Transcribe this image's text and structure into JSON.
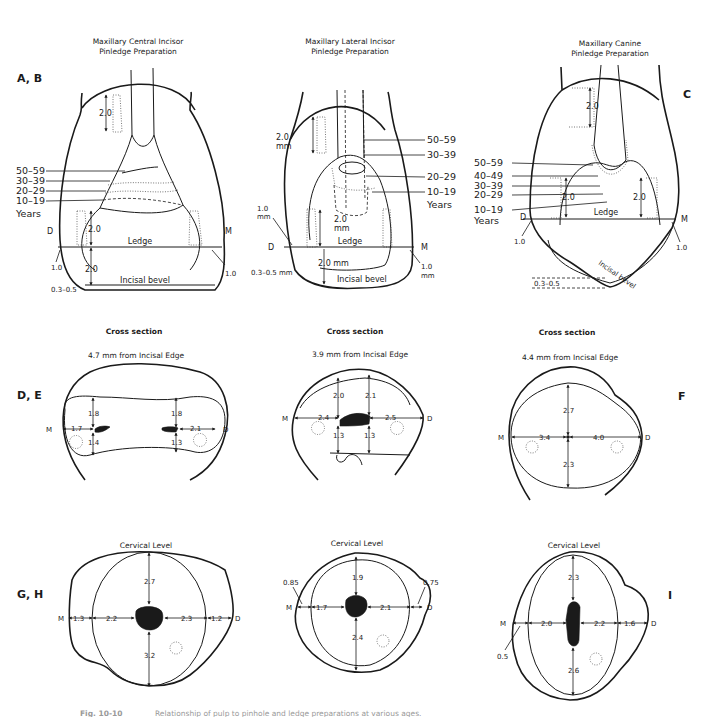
{
  "panels": {
    "ab": {
      "label": "A, B",
      "title_line1": "Maxillary Central Incisor",
      "title_line2": "Pinledge Preparation",
      "years_labels": [
        "50–59",
        "30–39",
        "20–29",
        "10–19"
      ],
      "years_word": "Years",
      "pin_depth": "2.0",
      "ledge_depth": "2.0",
      "ledge_label": "Ledge",
      "incisal_depth": "2.0",
      "incisal_bevel_label": "Incisal bevel",
      "bevel_range": "0.3–0.5",
      "distal_margin": "1.0",
      "mesial_margin": "1.0",
      "d_label": "D",
      "m_label": "M"
    },
    "lateral": {
      "title_line1": "Maxillary Lateral Incisor",
      "title_line2": "Pinledge Preparation",
      "years_labels": [
        "50–59",
        "30–39",
        "20–29",
        "10–19"
      ],
      "years_word": "Years",
      "pin_depth": "2.0",
      "pin_depth_unit": "mm",
      "ledge_depth": "2.0",
      "ledge_depth_unit": "mm",
      "ledge_label": "Ledge",
      "incisal_depth": "2.0 mm",
      "incisal_bevel_label": "Incisal bevel",
      "bevel_range": "0.3–0.5 mm",
      "distal_margin": "1.0",
      "distal_margin_unit": "mm",
      "mesial_margin": "1.0",
      "mesial_margin_unit": "mm",
      "d_label": "D",
      "m_label": "M"
    },
    "c": {
      "label": "C",
      "title_line1": "Maxillary Canine",
      "title_line2": "Pinledge Preparation",
      "years_labels": [
        "50–59",
        "40–49",
        "30–39",
        "20–29",
        "10–19"
      ],
      "years_word": "Years",
      "pin_depth": "2.0",
      "ledge_depth_left": "2.0",
      "ledge_depth_right": "2.0",
      "ledge_label": "Ledge",
      "incisal_bevel_label": "Incisal bevel",
      "bevel_range": "0.3–0.5",
      "distal_margin": "1.0",
      "mesial_margin": "1.0",
      "d_label": "D",
      "m_label": "M"
    },
    "de": {
      "label": "D, E",
      "header": "Cross section",
      "subheader": "4.7 mm from Incisal Edge",
      "m_label": "M",
      "d_label": "D",
      "left_top": "1.8",
      "left_bottom": "1.4",
      "left_side": "1.7",
      "right_top": "1.8",
      "right_bottom": "1.3",
      "right_side": "2.1"
    },
    "lateral_cross": {
      "header": "Cross section",
      "subheader": "3.9 mm from Incisal Edge",
      "m_label": "M",
      "d_label": "D",
      "left_top": "2.0",
      "right_top": "2.1",
      "left_side": "2.4",
      "right_side": "2.5",
      "left_bottom": "1.3",
      "right_bottom": "1.3"
    },
    "f": {
      "label": "F",
      "header": "Cross section",
      "subheader": "4.4 mm from Incisal Edge",
      "m_label": "M",
      "d_label": "D",
      "top": "2.7",
      "bottom": "2.3",
      "left": "3.4",
      "right": "4.0"
    },
    "gh": {
      "label": "G, H",
      "header": "Cervical Level",
      "m_label": "M",
      "d_label": "D",
      "top": "2.7",
      "bottom": "3.2",
      "outer_left": "1.3",
      "left": "2.2",
      "right": "2.3",
      "outer_right": "1.2"
    },
    "lateral_cervical": {
      "header": "Cervical Level",
      "m_label": "M",
      "d_label": "D",
      "top": "1.9",
      "bottom": "2.4",
      "left": "1.7",
      "right": "2.1",
      "outer_left": "0.85",
      "outer_right": "0.75"
    },
    "i": {
      "label": "I",
      "header": "Cervical Level",
      "m_label": "M",
      "d_label": "D",
      "top": "2.3",
      "bottom": "2.6",
      "left": "2.0",
      "right": "2.2",
      "outer_right": "1.6",
      "outer_left": "0.5"
    }
  },
  "caption": {
    "fig_label": "Fig. 10-10",
    "text": "Relationship of pulp to pinhole and ledge preparations at various ages."
  }
}
